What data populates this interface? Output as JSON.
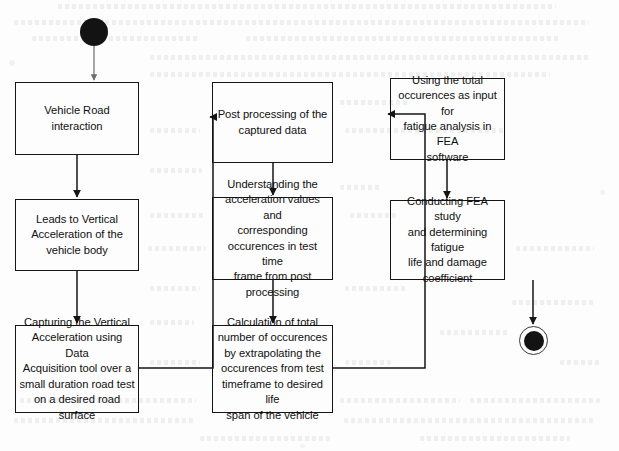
{
  "diagram": {
    "type": "uml-activity-flowchart",
    "background_color": "#fdfdfd",
    "stroke_color": "#151515",
    "text_color": "#101010",
    "nodes": [
      {
        "id": "start",
        "kind": "start",
        "label": "",
        "x": 80,
        "y": 18,
        "w": 28,
        "h": 28
      },
      {
        "id": "n1",
        "kind": "process",
        "label": "Vehicle Road interaction",
        "x": 15,
        "y": 82,
        "w": 124,
        "h": 73
      },
      {
        "id": "n2",
        "kind": "process",
        "label": "Leads to Vertical\nAcceleration of the\nvehicle body",
        "x": 15,
        "y": 199,
        "w": 124,
        "h": 72
      },
      {
        "id": "n3",
        "kind": "process",
        "label": "Capturing the Vertical\nAcceleration using Data\nAcquisition tool over a\nsmall duration road test\non a desired road surface",
        "x": 15,
        "y": 325,
        "w": 124,
        "h": 88
      },
      {
        "id": "n4",
        "kind": "process",
        "label": "Post processing of the\ncaptured data",
        "x": 212,
        "y": 82,
        "w": 121,
        "h": 81
      },
      {
        "id": "n5",
        "kind": "process",
        "label": "Understanding the\nacceleration values and\ncorresponding\noccurences in test time\nframe from post\nprocessing",
        "x": 212,
        "y": 197,
        "w": 121,
        "h": 83
      },
      {
        "id": "n6",
        "kind": "process",
        "label": "Calculation of total\nnumber of occurences\nby  extrapolating the\noccurences from test\ntimeframe to desired life\nspan of the vehicle",
        "x": 212,
        "y": 325,
        "w": 121,
        "h": 88
      },
      {
        "id": "n7",
        "kind": "process",
        "label": "Using the total\noccurences as input for\nfatigue analysis in FEA\nsoftware",
        "x": 390,
        "y": 78,
        "w": 115,
        "h": 82
      },
      {
        "id": "n8",
        "kind": "process",
        "label": "Conducting FEA study\nand determining fatigue\nlife and damage\ncoefficient",
        "x": 390,
        "y": 200,
        "w": 115,
        "h": 80
      },
      {
        "id": "end",
        "kind": "end",
        "label": "",
        "x": 519,
        "y": 326,
        "w": 29,
        "h": 29
      }
    ],
    "edges": [
      {
        "id": "e1",
        "from": "start",
        "to": "n1",
        "route": "straight-down"
      },
      {
        "id": "e2",
        "from": "n1",
        "to": "n2",
        "route": "straight-down"
      },
      {
        "id": "e3",
        "from": "n2",
        "to": "n3",
        "route": "straight-down"
      },
      {
        "id": "e4",
        "from": "n3",
        "to": "n4",
        "route": "right-up-right-elbow"
      },
      {
        "id": "e5",
        "from": "n4",
        "to": "n5",
        "route": "straight-down"
      },
      {
        "id": "e6",
        "from": "n5",
        "to": "n6",
        "route": "straight-down"
      },
      {
        "id": "e7",
        "from": "n6",
        "to": "n7",
        "route": "right-up-right-elbow"
      },
      {
        "id": "e8",
        "from": "n7",
        "to": "n8",
        "route": "straight-down"
      },
      {
        "id": "e9",
        "from": "n8",
        "to": "end",
        "route": "straight-down"
      }
    ]
  }
}
